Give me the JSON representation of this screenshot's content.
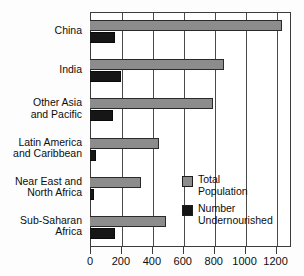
{
  "chart_data": {
    "type": "bar",
    "orientation": "horizontal",
    "title": "",
    "xlabel": "",
    "ylabel": "",
    "xlim": [
      0,
      1300
    ],
    "xticks": [
      0,
      200,
      400,
      600,
      800,
      1000,
      1200
    ],
    "xtick_labels": [
      "0",
      "200",
      "400",
      "600",
      "800",
      "1000",
      "1200"
    ],
    "grid": true,
    "grid_axis": "x",
    "legend_position": "inside-lower-right",
    "categories": [
      "China",
      "India",
      "Other Asia\nand Pacific",
      "Latin America\nand Caribbean",
      "Near East and\nNorth Africa",
      "Sub-Saharan\nAfrica"
    ],
    "series": [
      {
        "name": "Total Population",
        "color": "#8c8c8c",
        "values": [
          1240,
          865,
          795,
          445,
          330,
          490
        ]
      },
      {
        "name": "Number Undernourished",
        "color": "#161616",
        "values": [
          160,
          200,
          150,
          40,
          25,
          160
        ]
      }
    ]
  },
  "legend": {
    "items": [
      {
        "label": "Total\nPopulation",
        "swatch": "total"
      },
      {
        "label": "Number\nUndernourished",
        "swatch": "undernourished"
      }
    ]
  }
}
